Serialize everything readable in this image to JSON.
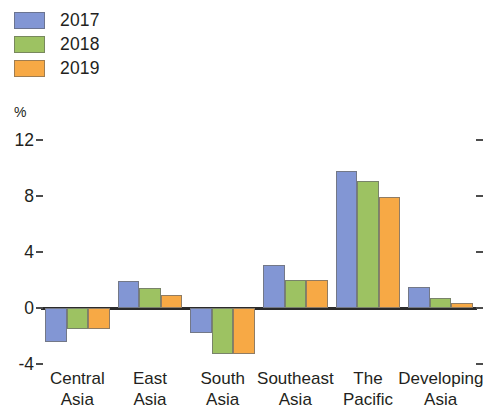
{
  "legend": {
    "items": [
      {
        "label": "2017",
        "color": "#8296d4"
      },
      {
        "label": "2018",
        "color": "#9dc262"
      },
      {
        "label": "2019",
        "color": "#f7a945"
      }
    ]
  },
  "axis": {
    "unit_label": "%",
    "y_ticks": [
      "12",
      "8",
      "4",
      "0",
      "-4"
    ]
  },
  "chart_data": {
    "type": "bar",
    "title": "",
    "subtitle": "",
    "xlabel": "",
    "ylabel": "%",
    "ylim": [
      -4,
      12
    ],
    "ytick_values": [
      12,
      8,
      4,
      0,
      -4
    ],
    "grid": false,
    "legend_position": "top-left",
    "categories": [
      "Central Asia",
      "East Asia",
      "South Asia",
      "Southeast Asia",
      "The Pacific",
      "Developing Asia"
    ],
    "category_lines": [
      [
        "Central",
        "Asia"
      ],
      [
        "East",
        "Asia"
      ],
      [
        "South",
        "Asia"
      ],
      [
        "Southeast",
        "Asia"
      ],
      [
        "The",
        "Pacific"
      ],
      [
        "Developing",
        "Asia"
      ]
    ],
    "series": [
      {
        "name": "2017",
        "color": "#8296d4",
        "values": [
          -2.4,
          1.9,
          -1.8,
          3.1,
          9.8,
          1.5
        ]
      },
      {
        "name": "2018",
        "color": "#9dc262",
        "values": [
          -1.5,
          1.4,
          -3.3,
          2.0,
          9.1,
          0.7
        ]
      },
      {
        "name": "2019",
        "color": "#f7a945",
        "values": [
          -1.5,
          0.9,
          -3.3,
          2.0,
          7.9,
          0.35
        ]
      }
    ]
  }
}
